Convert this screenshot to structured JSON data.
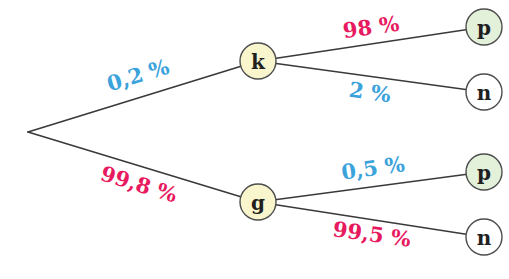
{
  "diagram": {
    "type": "probability-tree",
    "colors": {
      "blue": "#3ba3dc",
      "red": "#e81a5f",
      "edge": "#3a3a3a",
      "node_stroke": "#4d4d4d",
      "yellow_fill": "#f9f6cd",
      "green_fill": "#e4f1da",
      "white_fill": "#ffffff",
      "node_text": "#1f1f1f"
    },
    "nodes": [
      {
        "id": "k",
        "label": "k",
        "fill": "yellow"
      },
      {
        "id": "g",
        "label": "g",
        "fill": "yellow"
      },
      {
        "id": "p-upper",
        "label": "p",
        "fill": "green"
      },
      {
        "id": "n-upper",
        "label": "n",
        "fill": "white"
      },
      {
        "id": "p-lower",
        "label": "p",
        "fill": "green"
      },
      {
        "id": "n-lower",
        "label": "n",
        "fill": "white"
      }
    ],
    "edges": [
      {
        "from": "root",
        "to": "k",
        "label": "0,2 %",
        "color": "blue"
      },
      {
        "from": "root",
        "to": "g",
        "label": "99,8 %",
        "color": "red"
      },
      {
        "from": "k",
        "to": "p-upper",
        "label": "98 %",
        "color": "red"
      },
      {
        "from": "k",
        "to": "n-upper",
        "label": "2 %",
        "color": "blue"
      },
      {
        "from": "g",
        "to": "p-lower",
        "label": "0,5 %",
        "color": "blue"
      },
      {
        "from": "g",
        "to": "n-lower",
        "label": "99,5 %",
        "color": "red"
      }
    ]
  }
}
